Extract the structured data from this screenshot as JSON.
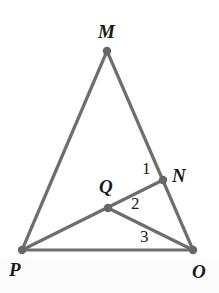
{
  "figure": {
    "kind": "euclidean-geometry-diagram",
    "canvas": {
      "width": 219,
      "height": 293,
      "background": "#ffffff"
    },
    "style": {
      "line_color": "#6e6e6e",
      "line_width": 3.2,
      "dot_color": "#666666",
      "label_color": "#1a1a1a"
    },
    "points": [
      {
        "id": "M",
        "label": "M",
        "x": 107,
        "y": 51,
        "role": "apex-vertex",
        "dot": true
      },
      {
        "id": "N",
        "label": "N",
        "x": 163,
        "y": 180,
        "role": "point-on-side-MO",
        "dot": true
      },
      {
        "id": "Q",
        "label": "Q",
        "x": 108,
        "y": 208,
        "role": "interior-point",
        "dot": true
      },
      {
        "id": "P",
        "label": "P",
        "x": 22,
        "y": 250,
        "role": "bottom-left-vertex",
        "dot": true
      },
      {
        "id": "O",
        "label": "O",
        "x": 193,
        "y": 250,
        "role": "bottom-right-vertex",
        "dot": true
      }
    ],
    "segments": [
      {
        "id": "MP",
        "from": "M",
        "to": "P",
        "kind": "triangle-side"
      },
      {
        "id": "MO",
        "from": "M",
        "to": "O",
        "kind": "triangle-side-through-N"
      },
      {
        "id": "PO",
        "from": "P",
        "to": "O",
        "kind": "triangle-base"
      },
      {
        "id": "PN",
        "from": "P",
        "to": "N",
        "kind": "cevian-through-Q"
      },
      {
        "id": "QO",
        "from": "Q",
        "to": "O",
        "kind": "segment"
      }
    ],
    "angle_marks": [
      {
        "id": "angle-1",
        "label": "1",
        "x": 147,
        "y": 169,
        "at_vertex": "N",
        "description": "angle at N between NM and NP"
      },
      {
        "id": "angle-2",
        "label": "2",
        "x": 136,
        "y": 204,
        "at_vertex": "Q",
        "description": "angle at Q between QN and QO"
      },
      {
        "id": "angle-3",
        "label": "3",
        "x": 145,
        "y": 237,
        "at_vertex": "O",
        "description": "angle at O between OQ and OP"
      }
    ]
  },
  "labels": {
    "M": "M",
    "N": "N",
    "Q": "Q",
    "P": "P",
    "O": "O",
    "one": "1",
    "two": "2",
    "three": "3"
  }
}
